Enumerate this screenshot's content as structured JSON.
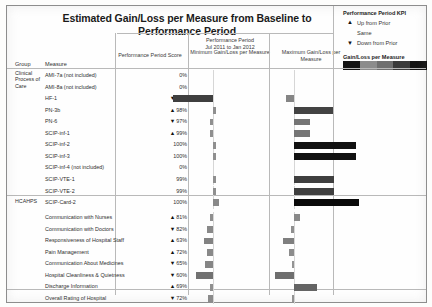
{
  "title": "Estimated Gain/Loss per Measure from Baseline to Performance Period",
  "legend": {
    "kpi_title": "Performance Period KPI",
    "items": [
      {
        "mark": "▲",
        "label": "Up from Prior"
      },
      {
        "mark": "",
        "label": "Same"
      },
      {
        "mark": "▼",
        "label": "Down from Prior"
      }
    ],
    "scale_title": "Gain/Loss per Measure",
    "scale_colors": [
      "#151515",
      "#8c8c8c",
      "#6f6f6f",
      "#3a3a3a",
      "#121212"
    ]
  },
  "columns": {
    "group": "Group",
    "measure": "Measure",
    "score": "Performance Period Score",
    "period_line1": "Performance Period",
    "period_line2": "Jul 2011 to Jan 2012",
    "minimum": "Minimum Gain/Loss per Measure",
    "maximum": "Maximum Gain/Loss per Measure"
  },
  "groups": [
    {
      "name": "Clinical Process of Care",
      "name_lines": [
        "Clinical",
        "Process of",
        "Care"
      ]
    },
    {
      "name": "HCAHPS",
      "name_lines": [
        "HCAHPS"
      ]
    }
  ],
  "chart_data": {
    "type": "bar",
    "title": "Estimated Gain/Loss per Measure from Baseline to Performance Period",
    "xlabel": "Gain/Loss per Measure",
    "ylabel": "Measure",
    "grid": false,
    "legend_position": "top-right",
    "series": [
      {
        "name": "Minimum Gain/Loss per Measure"
      },
      {
        "name": "Maximum Gain/Loss per Measure"
      }
    ],
    "categories": [
      "AMI-7a (not included)",
      "AMI-8a (not included)",
      "HF-1",
      "PN-3b",
      "PN-6",
      "SCIP-inf-1",
      "SCIP-inf-2",
      "SCIP-inf-3",
      "SCIP-inf-4 (not included)",
      "SCIP-VTE-1",
      "SCIP-VTE-2",
      "SCIP-Card-2",
      "Communication with Nurses",
      "Communication with Doctors",
      "Responsiveness of Hospital Staff",
      "Pain Management",
      "Communication About Medicines",
      "Hospital Cleanliness & Quietness",
      "Discharge Information",
      "Overall Rating of Hospital"
    ],
    "rows": [
      {
        "group": "Clinical Process of Care",
        "measure": "AMI-7a (not included)",
        "score": "0%",
        "kpi": "",
        "min": 0,
        "max": 0
      },
      {
        "group": "Clinical Process of Care",
        "measure": "AMI-8a (not included)",
        "score": "0%",
        "kpi": "",
        "min": 0,
        "max": 0
      },
      {
        "group": "Clinical Process of Care",
        "measure": "HF-1",
        "score": "92%",
        "kpi": "▼",
        "min": -26,
        "max": -5
      },
      {
        "group": "Clinical Process of Care",
        "measure": "PN-3b",
        "score": "98%",
        "kpi": "▲",
        "min": 2,
        "max": 25
      },
      {
        "group": "Clinical Process of Care",
        "measure": "PN-6",
        "score": "97%",
        "kpi": "▼",
        "min": -2,
        "max": 10
      },
      {
        "group": "Clinical Process of Care",
        "measure": "SCIP-inf-1",
        "score": "99%",
        "kpi": "▲",
        "min": -2,
        "max": 10
      },
      {
        "group": "Clinical Process of Care",
        "measure": "SCIP-inf-2",
        "score": "100%",
        "kpi": "",
        "min": 2,
        "max": 40
      },
      {
        "group": "Clinical Process of Care",
        "measure": "SCIP-inf-3",
        "score": "100%",
        "kpi": "",
        "min": 2,
        "max": 40
      },
      {
        "group": "Clinical Process of Care",
        "measure": "SCIP-inf-4 (not included)",
        "score": "0%",
        "kpi": "",
        "min": 0,
        "max": 0
      },
      {
        "group": "Clinical Process of Care",
        "measure": "SCIP-VTE-1",
        "score": "99%",
        "kpi": "",
        "min": 2,
        "max": 26
      },
      {
        "group": "Clinical Process of Care",
        "measure": "SCIP-VTE-2",
        "score": "99%",
        "kpi": "",
        "min": 2,
        "max": 26
      },
      {
        "group": "Clinical Process of Care",
        "measure": "SCIP-Card-2",
        "score": "100%",
        "kpi": "",
        "min": 4,
        "max": 42
      },
      {
        "group": "HCAHPS",
        "measure": "Communication with Nurses",
        "score": "81%",
        "kpi": "▲",
        "min": -2,
        "max": 4
      },
      {
        "group": "HCAHPS",
        "measure": "Communication with Doctors",
        "score": "82%",
        "kpi": "▼",
        "min": -4,
        "max": -2
      },
      {
        "group": "HCAHPS",
        "measure": "Responsiveness of Hospital Staff",
        "score": "63%",
        "kpi": "▲",
        "min": -6,
        "max": -7
      },
      {
        "group": "HCAHPS",
        "measure": "Pain Management",
        "score": "72%",
        "kpi": "▲",
        "min": -4,
        "max": -3
      },
      {
        "group": "HCAHPS",
        "measure": "Communication About Medicines",
        "score": "65%",
        "kpi": "▼",
        "min": -5,
        "max": -1
      },
      {
        "group": "HCAHPS",
        "measure": "Hospital Cleanliness & Quietness",
        "score": "60%",
        "kpi": "▼",
        "min": -11,
        "max": -12
      },
      {
        "group": "HCAHPS",
        "measure": "Discharge Information",
        "score": "69%",
        "kpi": "▲",
        "min": -2,
        "max": 15
      },
      {
        "group": "HCAHPS",
        "measure": "Overall Rating of Hospital",
        "score": "72%",
        "kpi": "▼",
        "min": -3,
        "max": -1
      }
    ]
  }
}
